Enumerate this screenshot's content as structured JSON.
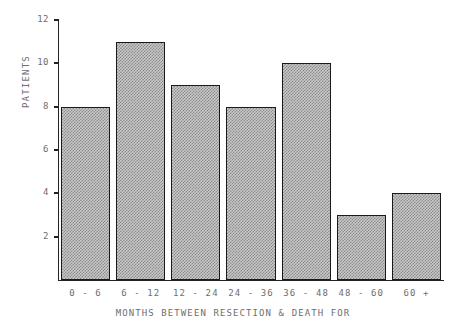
{
  "chart_data": {
    "type": "bar",
    "title": "",
    "subtitle": "",
    "categories": [
      "0 - 6",
      "6 - 12",
      "12 - 24",
      "24 - 36",
      "36 - 48",
      "48 - 60",
      "60 +"
    ],
    "values": [
      8,
      11,
      9,
      8,
      10,
      3,
      4
    ],
    "xlabel": "MONTHS BETWEEN RESECTION & DEATH FOR",
    "ylabel": "PATIENTS",
    "ylim": [
      0,
      12
    ],
    "yticks": [
      2,
      4,
      6,
      8,
      10,
      12
    ],
    "ytick_labels": [
      "2",
      "4",
      "6",
      "8",
      "10",
      "12"
    ],
    "grid": false,
    "legend": false,
    "legend_position": "none",
    "bar_fill": "#c9c9c9",
    "bar_hatch_color": "#8a8a8a",
    "bar_edge_color": "#1a1a1a",
    "axis_color": "#222222",
    "text_color": "#6e6e6e",
    "background": "#ffffff"
  }
}
